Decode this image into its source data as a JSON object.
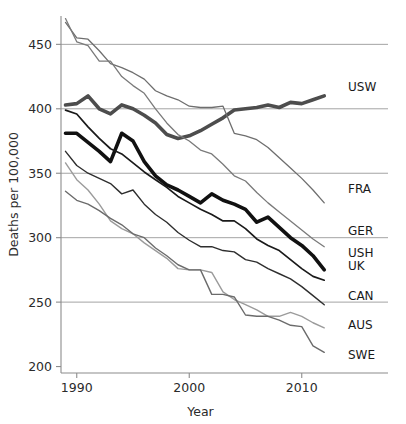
{
  "chart_data": {
    "type": "line",
    "title": "",
    "xlabel": "Year",
    "ylabel": "Deaths per 100,000",
    "xlim": [
      1988.6,
      2013.4
    ],
    "ylim": [
      195,
      472
    ],
    "xticks": [
      1990,
      2000,
      2010
    ],
    "xticklabels": [
      "1990",
      "2000",
      "2010"
    ],
    "yticks": [
      200,
      250,
      300,
      350,
      400,
      450
    ],
    "yticklabels": [
      "200",
      "250",
      "300",
      "350",
      "400",
      "450"
    ],
    "grid": "horizontal",
    "legend_position": "right-edge-labels",
    "x": [
      1989,
      1990,
      1991,
      1992,
      1993,
      1994,
      1995,
      1996,
      1997,
      1998,
      1999,
      2000,
      2001,
      2002,
      2003,
      2004,
      2005,
      2006,
      2007,
      2008,
      2009,
      2010,
      2011,
      2012
    ],
    "series": [
      {
        "name": "USW",
        "label": "USW",
        "color": "#4d4d4d",
        "width": 3.6,
        "label_y_value": 417,
        "values": [
          403,
          404,
          410,
          400,
          396,
          403,
          400,
          395,
          389,
          380,
          377,
          379,
          383,
          388,
          393,
          399,
          400,
          401,
          403,
          401,
          405,
          404,
          407,
          410
        ]
      },
      {
        "name": "USH",
        "label": "USH",
        "color": "#111111",
        "width": 3.6,
        "label_y_value": 288,
        "values": [
          381,
          381,
          374,
          367,
          359,
          381,
          375,
          359,
          348,
          341,
          337,
          332,
          327,
          334,
          329,
          326,
          322,
          312,
          316,
          308,
          300,
          294,
          286,
          275
        ]
      },
      {
        "name": "FRA",
        "label": "FRA",
        "color": "#6e6e6e",
        "width": 1.3,
        "label_y_value": 338,
        "values": [
          467,
          455,
          454,
          445,
          435,
          432,
          428,
          423,
          414,
          410,
          407,
          402,
          401,
          401,
          402,
          381,
          379,
          376,
          370,
          362,
          354,
          346,
          337,
          327
        ]
      },
      {
        "name": "GER",
        "label": "GER",
        "color": "#7a7a7a",
        "width": 1.3,
        "label_y_value": 305,
        "values": [
          470,
          452,
          449,
          437,
          437,
          425,
          418,
          412,
          400,
          389,
          380,
          375,
          368,
          365,
          357,
          348,
          344,
          335,
          327,
          320,
          313,
          306,
          299,
          293
        ]
      },
      {
        "name": "UK",
        "label": "UK",
        "color": "#1a1a1a",
        "width": 1.7,
        "label_y_value": 278,
        "values": [
          399,
          396,
          386,
          377,
          369,
          365,
          358,
          351,
          345,
          339,
          332,
          327,
          322,
          318,
          313,
          313,
          307,
          299,
          294,
          290,
          283,
          276,
          270,
          267
        ]
      },
      {
        "name": "CAN",
        "label": "CAN",
        "color": "#2e2e2e",
        "width": 1.4,
        "label_y_value": 255,
        "values": [
          367,
          356,
          350,
          346,
          342,
          334,
          337,
          326,
          318,
          312,
          304,
          298,
          293,
          293,
          290,
          289,
          283,
          281,
          276,
          272,
          268,
          262,
          255,
          248
        ]
      },
      {
        "name": "AUS",
        "label": "AUS",
        "color": "#9b9b9b",
        "width": 1.4,
        "label_y_value": 232,
        "values": [
          358,
          345,
          337,
          326,
          313,
          307,
          303,
          296,
          290,
          284,
          276,
          275,
          275,
          273,
          258,
          252,
          248,
          244,
          239,
          239,
          242,
          239,
          234,
          230
        ]
      },
      {
        "name": "SWE",
        "label": "SWE",
        "color": "#6b6b6b",
        "width": 1.4,
        "label_y_value": 209,
        "values": [
          336,
          329,
          326,
          321,
          315,
          310,
          303,
          300,
          292,
          286,
          279,
          275,
          275,
          256,
          256,
          254,
          240,
          239,
          239,
          236,
          232,
          231,
          216,
          211
        ]
      }
    ]
  }
}
